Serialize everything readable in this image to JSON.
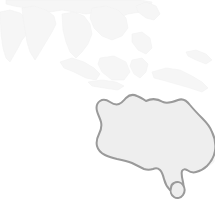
{
  "map": {
    "title": "World map thumbnail centred on Australia",
    "region_highlighted": "Australia",
    "projection": "equirectangular",
    "background_color": "#ffffff",
    "colors": {
      "background": "#ffffff",
      "context_land_fill": "#f6f6f6",
      "context_land_stroke": "#f2f2f2",
      "highlight_fill": "#eeeeee",
      "highlight_stroke": "#9a9a9a"
    },
    "highlight_stroke_width": "2",
    "context_regions": [
      {
        "name": "africa-horn-arabia",
        "style": "faint"
      },
      {
        "name": "indian-subcontinent",
        "style": "faint"
      },
      {
        "name": "central-east-asia",
        "style": "faint"
      },
      {
        "name": "southeast-asia-mainland",
        "style": "faint"
      },
      {
        "name": "indonesia-archipelago",
        "style": "faint"
      },
      {
        "name": "philippines",
        "style": "faint"
      },
      {
        "name": "new-guinea",
        "style": "faint"
      },
      {
        "name": "pacific-islands",
        "style": "faint"
      }
    ],
    "highlight_regions": [
      {
        "name": "australia-mainland",
        "style": "highlighted"
      },
      {
        "name": "tasmania",
        "style": "highlighted"
      }
    ]
  }
}
